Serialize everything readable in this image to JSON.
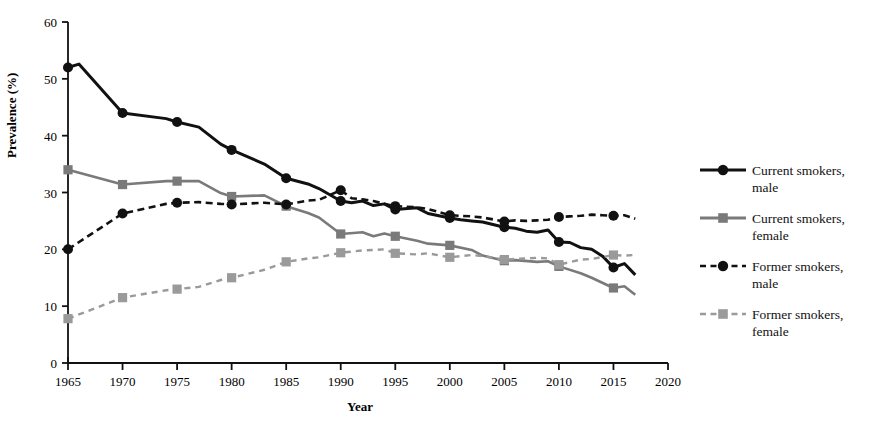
{
  "chart_data": {
    "type": "line",
    "title": "",
    "xlabel": "Year",
    "ylabel": "Prevalence (%)",
    "xlim": [
      1965,
      2020
    ],
    "ylim": [
      0,
      60
    ],
    "xticks": [
      1965,
      1970,
      1975,
      1980,
      1985,
      1990,
      1995,
      2000,
      2005,
      2010,
      2015,
      2020
    ],
    "yticks": [
      0,
      10,
      20,
      30,
      40,
      50,
      60
    ],
    "grid": false,
    "legend_position": "right",
    "series": [
      {
        "name": "Current smokers, male",
        "key": "current_male",
        "color": "#111111",
        "dash": "solid",
        "marker": "circle",
        "x": [
          1965,
          1966,
          1970,
          1974,
          1975,
          1977,
          1979,
          1980,
          1983,
          1985,
          1987,
          1988,
          1990,
          1991,
          1992,
          1993,
          1994,
          1995,
          1997,
          1998,
          2000,
          2001,
          2002,
          2003,
          2005,
          2006,
          2007,
          2008,
          2009,
          2010,
          2011,
          2012,
          2013,
          2014,
          2015,
          2016,
          2017
        ],
        "y": [
          52.0,
          52.6,
          44.0,
          43.0,
          42.4,
          41.5,
          38.5,
          37.5,
          35.0,
          32.5,
          31.5,
          30.7,
          28.5,
          28.2,
          28.5,
          27.7,
          28.0,
          27.0,
          27.3,
          26.3,
          25.5,
          25.2,
          25.0,
          24.8,
          23.9,
          23.7,
          23.2,
          23.0,
          23.4,
          21.3,
          21.2,
          20.3,
          20.0,
          18.8,
          16.8,
          17.5,
          15.5
        ]
      },
      {
        "name": "Current smokers, female",
        "key": "current_female",
        "color": "#7a7a7a",
        "dash": "solid",
        "marker": "square",
        "x": [
          1965,
          1970,
          1974,
          1975,
          1977,
          1979,
          1980,
          1983,
          1985,
          1987,
          1988,
          1990,
          1992,
          1993,
          1994,
          1995,
          1997,
          1998,
          2000,
          2002,
          2003,
          2005,
          2006,
          2008,
          2009,
          2010,
          2012,
          2013,
          2015,
          2016,
          2017
        ],
        "y": [
          34.0,
          31.4,
          32.0,
          32.0,
          32.0,
          29.9,
          29.3,
          29.5,
          27.6,
          26.4,
          25.6,
          22.7,
          23.0,
          22.3,
          22.8,
          22.3,
          21.5,
          21.0,
          20.7,
          19.9,
          18.9,
          18.0,
          18.1,
          17.8,
          17.9,
          17.0,
          15.8,
          15.0,
          13.2,
          13.5,
          12.0
        ]
      },
      {
        "name": "Former smokers, male",
        "key": "former_male",
        "color": "#111111",
        "dash": "dashed",
        "marker": "circle",
        "x": [
          1965,
          1970,
          1974,
          1975,
          1977,
          1979,
          1980,
          1983,
          1985,
          1987,
          1988,
          1990,
          1991,
          1992,
          1993,
          1994,
          1995,
          1997,
          1998,
          2000,
          2001,
          2002,
          2003,
          2005,
          2006,
          2007,
          2008,
          2009,
          2010,
          2011,
          2012,
          2013,
          2014,
          2015,
          2016,
          2017
        ],
        "y": [
          20.0,
          26.3,
          28.0,
          28.2,
          28.3,
          28.0,
          27.9,
          28.2,
          27.9,
          28.6,
          28.7,
          30.4,
          29.0,
          28.8,
          28.5,
          28.0,
          27.6,
          27.4,
          27.1,
          26.0,
          25.9,
          25.8,
          25.6,
          24.9,
          25.1,
          25.0,
          25.1,
          25.2,
          25.7,
          25.8,
          25.9,
          26.1,
          26.0,
          25.9,
          26.0,
          25.4
        ]
      },
      {
        "name": "Former smokers, female",
        "key": "former_female",
        "color": "#9a9a9a",
        "dash": "dashed",
        "marker": "square",
        "x": [
          1965,
          1970,
          1974,
          1975,
          1977,
          1979,
          1980,
          1983,
          1985,
          1987,
          1988,
          1990,
          1992,
          1993,
          1994,
          1995,
          1997,
          1998,
          2000,
          2002,
          2003,
          2005,
          2006,
          2008,
          2009,
          2010,
          2012,
          2013,
          2015,
          2016,
          2017
        ],
        "y": [
          7.8,
          11.5,
          12.8,
          13.0,
          13.4,
          14.6,
          15.0,
          16.4,
          17.8,
          18.4,
          18.6,
          19.4,
          19.8,
          19.9,
          20.0,
          19.3,
          19.1,
          19.3,
          18.6,
          19.0,
          18.8,
          18.2,
          18.3,
          18.5,
          18.4,
          17.3,
          18.2,
          18.3,
          19.0,
          18.9,
          19.0
        ]
      }
    ]
  },
  "legend": {
    "items": [
      {
        "label_line1": "Current smokers,",
        "label_line2": "male"
      },
      {
        "label_line1": "Current smokers,",
        "label_line2": "female"
      },
      {
        "label_line1": "Former smokers,",
        "label_line2": "male"
      },
      {
        "label_line1": "Former smokers,",
        "label_line2": "female"
      }
    ]
  },
  "axes": {
    "x_title": "Year",
    "y_title": "Prevalence (%)"
  }
}
